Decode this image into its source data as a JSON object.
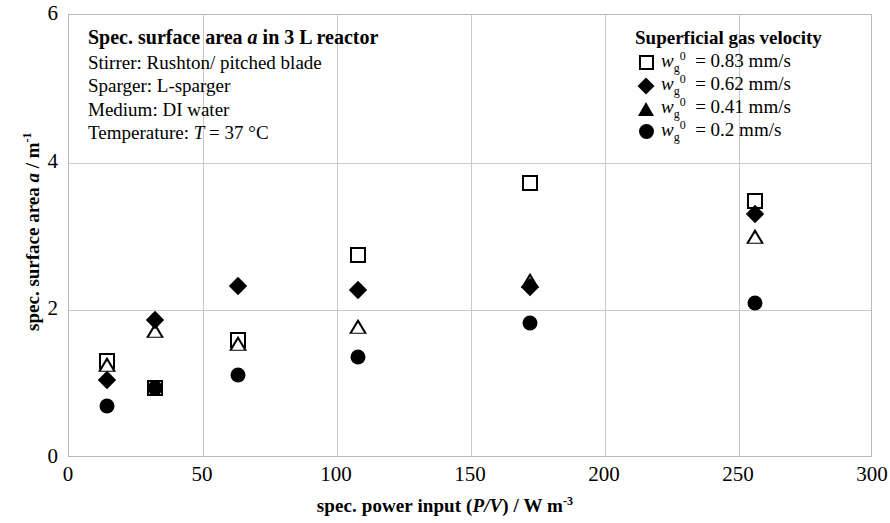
{
  "chart_data": {
    "type": "scatter",
    "title": "Spec. surface area a in 3 L reactor",
    "xlabel": "spec. power input (P/V) / W m-3",
    "ylabel": "spec. surface area a / m-1",
    "xlim": [
      0,
      300
    ],
    "ylim": [
      0,
      6
    ],
    "xticks": [
      0,
      50,
      100,
      150,
      200,
      250,
      300
    ],
    "yticks": [
      0,
      2,
      4,
      6
    ],
    "grid": true,
    "legend_position": "top-right",
    "series": [
      {
        "name": "wg0 = 0.83 mm/s",
        "marker": "open-square",
        "points": [
          {
            "x": 14,
            "y": 1.32
          },
          {
            "x": 32,
            "y": 0.95
          },
          {
            "x": 63,
            "y": 1.6
          },
          {
            "x": 108,
            "y": 2.75
          },
          {
            "x": 172,
            "y": 3.72
          },
          {
            "x": 256,
            "y": 3.48
          }
        ]
      },
      {
        "name": "wg0 = 0.62 mm/s",
        "marker": "filled-diamond",
        "points": [
          {
            "x": 14,
            "y": 1.05
          },
          {
            "x": 32,
            "y": 1.87
          },
          {
            "x": 63,
            "y": 2.33
          },
          {
            "x": 108,
            "y": 2.28
          },
          {
            "x": 172,
            "y": 2.32
          },
          {
            "x": 256,
            "y": 3.3
          }
        ]
      },
      {
        "name": "wg0 = 0.41 mm/s",
        "marker": "open-triangle",
        "points": [
          {
            "x": 14,
            "y": 1.26
          },
          {
            "x": 32,
            "y": 1.72
          },
          {
            "x": 63,
            "y": 1.55
          },
          {
            "x": 108,
            "y": 1.77
          },
          {
            "x": 172,
            "y": 2.4
          },
          {
            "x": 256,
            "y": 3.0
          }
        ]
      },
      {
        "name": "wg0 = 0.2 mm/s",
        "marker": "filled-circle",
        "points": [
          {
            "x": 14,
            "y": 0.7
          },
          {
            "x": 32,
            "y": 0.95
          },
          {
            "x": 63,
            "y": 1.12
          },
          {
            "x": 108,
            "y": 1.37
          },
          {
            "x": 172,
            "y": 1.83
          },
          {
            "x": 256,
            "y": 2.1
          }
        ]
      }
    ]
  },
  "caption": {
    "title": "Spec. surface area a in 3 L reactor",
    "lines": [
      "Stirrer: Rushton/ pitched blade",
      "Sparger:  L-sparger",
      "Medium: DI water",
      "Temperature: T = 37 °C"
    ]
  },
  "legend": {
    "title": "Superficial gas velocity",
    "items": [
      {
        "marker": "open-square",
        "value": "0.83",
        "unit": "mm/s"
      },
      {
        "marker": "filled-diamond",
        "value": "0.62",
        "unit": "mm/s"
      },
      {
        "marker": "open-triangle",
        "value": "0.41",
        "unit": "mm/s"
      },
      {
        "marker": "filled-circle",
        "value": "0.2",
        "unit": "mm/s"
      }
    ]
  },
  "axes": {
    "x_tick_labels": [
      "0",
      "50",
      "100",
      "150",
      "200",
      "250",
      "300"
    ],
    "y_tick_labels": [
      "0",
      "2",
      "4",
      "6"
    ]
  },
  "colors": {
    "marker": "#000000",
    "grid": "#c9c9c9",
    "frame": "#b9b9b9",
    "background": "#ffffff"
  }
}
